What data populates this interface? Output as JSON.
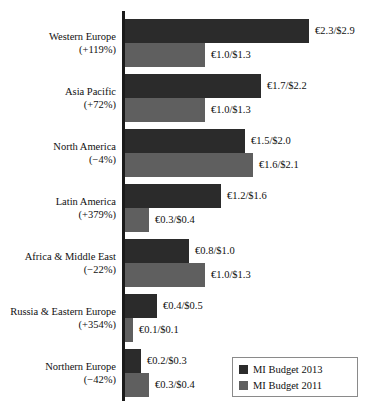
{
  "chart_data": {
    "type": "bar",
    "orientation": "horizontal",
    "title": "",
    "subtitle": "",
    "xlabel": "",
    "ylabel": "",
    "grid": false,
    "axis_visible": true,
    "xlim": [
      0,
      2.3
    ],
    "legend_position": "bottom-right",
    "categories": [
      "Western Europe",
      "Asia Pacific",
      "North America",
      "Latin America",
      "Africa & Middle East",
      "Russia & Eastern Europe",
      "Northern Europe"
    ],
    "category_deltas": [
      "(+119%)",
      "(+72%)",
      "(−4%)",
      "(+379%)",
      "(−22%)",
      "(+354%)",
      "(−42%)"
    ],
    "series": [
      {
        "name": "MI Budget 2013",
        "color": "#2b2b2b",
        "values": [
          2.3,
          1.7,
          1.5,
          1.2,
          0.8,
          0.4,
          0.2
        ],
        "labels": [
          "€2.3/$2.9",
          "€1.7/$2.2",
          "€1.5/$2.0",
          "€1.2/$1.6",
          "€0.8/$1.0",
          "€0.4/$0.5",
          "€0.2/$0.3"
        ]
      },
      {
        "name": "MI Budget 2011",
        "color": "#5f5f5f",
        "values": [
          1.0,
          1.0,
          1.6,
          0.3,
          1.0,
          0.1,
          0.3
        ],
        "labels": [
          "€1.0/$1.3",
          "€1.0/$1.3",
          "€1.6/$2.1",
          "€0.3/$0.4",
          "€1.0/$1.3",
          "€0.1/$0.1",
          "€0.3/$0.4"
        ]
      }
    ]
  },
  "legend": {
    "entries": [
      {
        "label": "MI Budget 2013",
        "color": "#2b2b2b"
      },
      {
        "label": "MI Budget 2011",
        "color": "#5f5f5f"
      }
    ]
  },
  "rows": [
    {
      "region": "Western Europe",
      "delta": "(+119%)",
      "v2013": 2.3,
      "v2011": 1.0,
      "label2013": "€2.3/$2.9",
      "label2011": "€1.0/$1.3"
    },
    {
      "region": "Asia Pacific",
      "delta": "(+72%)",
      "v2013": 1.7,
      "v2011": 1.0,
      "label2013": "€1.7/$2.2",
      "label2011": "€1.0/$1.3"
    },
    {
      "region": "North America",
      "delta": "(−4%)",
      "v2013": 1.5,
      "v2011": 1.6,
      "label2013": "€1.5/$2.0",
      "label2011": "€1.6/$2.1"
    },
    {
      "region": "Latin America",
      "delta": "(+379%)",
      "v2013": 1.2,
      "v2011": 0.3,
      "label2013": "€1.2/$1.6",
      "label2011": "€0.3/$0.4"
    },
    {
      "region": "Africa & Middle East",
      "delta": "(−22%)",
      "v2013": 0.8,
      "v2011": 1.0,
      "label2013": "€0.8/$1.0",
      "label2011": "€1.0/$1.3"
    },
    {
      "region": "Russia & Eastern Europe",
      "delta": "(+354%)",
      "v2013": 0.4,
      "v2011": 0.1,
      "label2013": "€0.4/$0.5",
      "label2011": "€0.1/$0.1"
    },
    {
      "region": "Northern Europe",
      "delta": "(−42%)",
      "v2013": 0.2,
      "v2011": 0.3,
      "label2013": "€0.2/$0.3",
      "label2011": "€0.3/$0.4"
    }
  ],
  "scale": {
    "px_per_unit": 80,
    "row_top_first": 19,
    "row_pitch": 55,
    "bar_height": 24
  }
}
